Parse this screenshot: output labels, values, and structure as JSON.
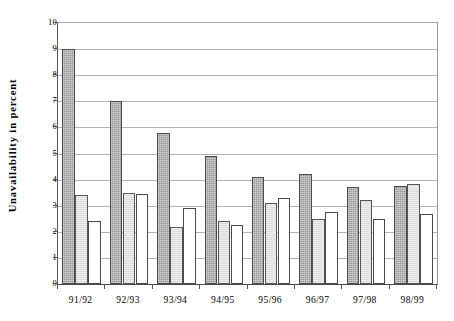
{
  "chart_data": {
    "type": "bar",
    "title": "",
    "xlabel": "",
    "ylabel": "Unavailability in percent",
    "categories": [
      "91/92",
      "92/93",
      "93/94",
      "94/95",
      "95/96",
      "96/97",
      "97/98",
      "98/99"
    ],
    "series": [
      {
        "name": "series-1",
        "color": "#a9a9a9",
        "values": [
          9.0,
          7.0,
          5.8,
          4.9,
          4.1,
          4.2,
          3.7,
          3.75
        ]
      },
      {
        "name": "series-2",
        "color": "#e2e2e2",
        "values": [
          3.4,
          3.5,
          2.2,
          2.4,
          3.1,
          2.5,
          3.2,
          3.85
        ]
      },
      {
        "name": "series-3",
        "color": "#ffffff",
        "values": [
          2.4,
          3.45,
          2.9,
          2.25,
          3.3,
          2.75,
          2.5,
          2.7
        ]
      }
    ],
    "ylim": [
      0,
      10
    ],
    "yticks": [
      0,
      1,
      2,
      3,
      4,
      5,
      6,
      7,
      8,
      9,
      10
    ],
    "ytick_labels": [
      "0",
      "1",
      "2",
      "3",
      "4",
      "5",
      "6",
      "7",
      "8",
      "9",
      "10"
    ],
    "grid": true,
    "grid_axis": "y",
    "legend": "none",
    "legend_position": "none"
  },
  "axes": {
    "y_title": "Unavailability in percent"
  }
}
